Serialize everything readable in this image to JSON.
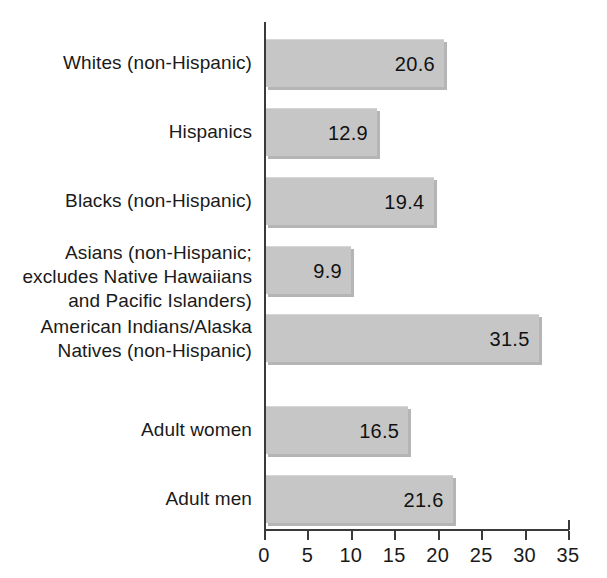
{
  "chart_data": {
    "type": "bar",
    "orientation": "horizontal",
    "title": "",
    "subtitle": "",
    "xlabel": "",
    "ylabel": "",
    "xlim": [
      0,
      35
    ],
    "xticks": [
      0,
      5,
      10,
      15,
      20,
      25,
      30,
      35
    ],
    "xtick_labels": [
      "0",
      "5",
      "10",
      "15",
      "20",
      "25",
      "30",
      "35"
    ],
    "grid": false,
    "legend": null,
    "bar_color": "#c6c6c6",
    "axis_color": "#3a3a3a",
    "text_color": "#1a1a1a",
    "categories": [
      "Whites (non-Hispanic)",
      "Hispanics",
      "Blacks (non-Hispanic)",
      "Asians (non-Hispanic; excludes Native Hawaiians and Pacific Islanders)",
      "American Indians/Alaska Natives (non-Hispanic)",
      "Adult women",
      "Adult men"
    ],
    "values": [
      20.6,
      12.9,
      19.4,
      9.9,
      31.5,
      16.5,
      21.6
    ],
    "value_labels": [
      "20.6",
      "12.9",
      "19.4",
      "9.9",
      "31.5",
      "16.5",
      "21.6"
    ],
    "bars": [
      {
        "label_lines": [
          "Whites (non-Hispanic)"
        ],
        "value": 20.6,
        "value_label": "20.6",
        "label_top": 51,
        "bar_top": 39,
        "bar_height": 48
      },
      {
        "label_lines": [
          "Hispanics"
        ],
        "value": 12.9,
        "value_label": "12.9",
        "label_top": 120,
        "bar_top": 108,
        "bar_height": 48
      },
      {
        "label_lines": [
          "Blacks (non-Hispanic)"
        ],
        "value": 19.4,
        "value_label": "19.4",
        "label_top": 189,
        "bar_top": 177,
        "bar_height": 48
      },
      {
        "label_lines": [
          "Asians (non-Hispanic;",
          "excludes Native Hawaiians",
          "and Pacific Islanders)"
        ],
        "value": 9.9,
        "value_label": "9.9",
        "label_top": 241,
        "bar_top": 246,
        "bar_height": 48
      },
      {
        "label_lines": [
          "American Indians/Alaska",
          "Natives (non-Hispanic)"
        ],
        "value": 31.5,
        "value_label": "31.5",
        "label_top": 315,
        "bar_top": 314,
        "bar_height": 48
      },
      {
        "label_lines": [
          "Adult women"
        ],
        "value": 16.5,
        "value_label": "16.5",
        "label_top": 418,
        "bar_top": 406,
        "bar_height": 48
      },
      {
        "label_lines": [
          "Adult men"
        ],
        "value": 21.6,
        "value_label": "21.6",
        "label_top": 487,
        "bar_top": 475,
        "bar_height": 48
      }
    ]
  }
}
